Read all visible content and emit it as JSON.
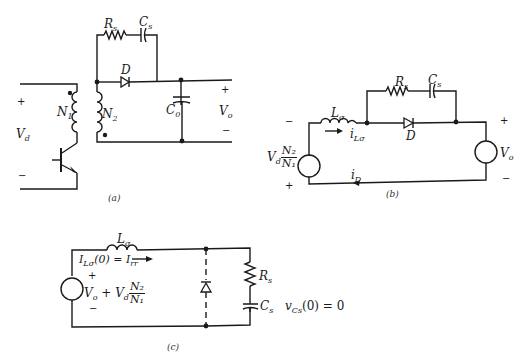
{
  "figure": {
    "panels": [
      {
        "id": "a",
        "caption": "(a)"
      },
      {
        "id": "b",
        "caption": "(b)"
      },
      {
        "id": "c",
        "caption": "(c)"
      }
    ]
  },
  "panel_a": {
    "caption": "(a)",
    "labels": {
      "Rs": "R",
      "Rs_sub": "s",
      "Cs": "C",
      "Cs_sub": "s",
      "D": "D",
      "N1": "N",
      "N1_sub": "1",
      "N2": "N",
      "N2_sub": "2",
      "C0": "C",
      "C0_sub": "0",
      "Vd": "V",
      "Vd_sub": "d",
      "Vo": "V",
      "Vo_sub": "o",
      "plus": "+",
      "minus": "−"
    }
  },
  "panel_b": {
    "caption": "(b)",
    "labels": {
      "Lsigma": "L",
      "Lsigma_sub": "σ",
      "iLsigma": "i",
      "iLsigma_sub": "Lσ",
      "Rs": "R",
      "Rs_sub": "s",
      "Cs": "C",
      "Cs_sub": "s",
      "D": "D",
      "iD": "i",
      "iD_sub": "D",
      "Vd": "V",
      "Vd_sub": "d",
      "frac_num": "N₂",
      "frac_den": "N₁",
      "Vo": "V",
      "Vo_sub": "o",
      "plus": "+",
      "minus": "−"
    }
  },
  "panel_c": {
    "caption": "(c)",
    "labels": {
      "Lsigma": "L",
      "Lsigma_sub": "σ",
      "initial_current": "I",
      "initial_current_sub": "Lσ",
      "initial_current_rest": "(0) = I",
      "initial_current_rr": "rr",
      "source_expr": "V",
      "source_expr_sub": "o",
      "source_expr_mid": " + V",
      "source_expr_sub2": "d",
      "frac_num": "N₂",
      "frac_den": "N₁",
      "Rs": "R",
      "Rs_sub": "s",
      "Cs": "C",
      "Cs_sub": "s",
      "vcs": "v",
      "vcs_sub": "Cs",
      "vcs_rest": "(0) = 0",
      "plus": "+",
      "minus": "−"
    }
  }
}
